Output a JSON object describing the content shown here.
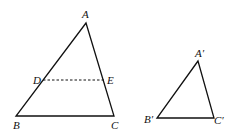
{
  "diagram": {
    "triangle_large": {
      "vertices": {
        "A": "A",
        "B": "B",
        "C": "C"
      },
      "points_on_sides": {
        "D": "D",
        "E": "E"
      },
      "segment_DE": "dashed"
    },
    "triangle_small": {
      "vertices": {
        "A": "A′",
        "B": "B′",
        "C": "C′"
      }
    }
  }
}
